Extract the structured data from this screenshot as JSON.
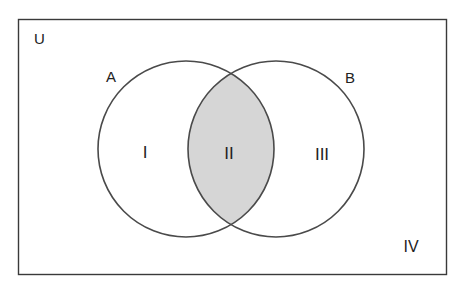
{
  "diagram": {
    "type": "venn",
    "universe_label": "U",
    "sets": [
      {
        "label": "A"
      },
      {
        "label": "B"
      }
    ],
    "regions": [
      {
        "label": "I",
        "meaning": "A only",
        "shaded": false
      },
      {
        "label": "II",
        "meaning": "A and B",
        "shaded": true
      },
      {
        "label": "III",
        "meaning": "B only",
        "shaded": false
      },
      {
        "label": "IV",
        "meaning": "neither A nor B",
        "shaded": false
      }
    ],
    "colors": {
      "stroke": "#4a4a4a",
      "shade": "#d6d6d6",
      "background": "#ffffff"
    }
  }
}
